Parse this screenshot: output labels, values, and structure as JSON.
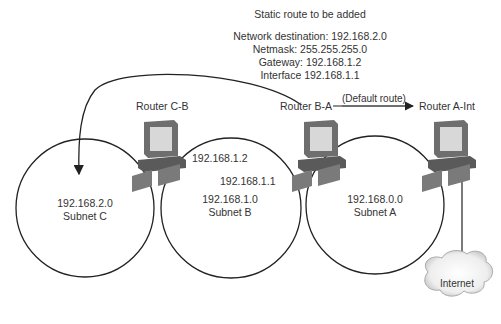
{
  "title": "Static route to be added",
  "route_details": {
    "network_destination": "Network destination: 192.168.2.0",
    "netmask": "Netmask: 255.255.255.0",
    "gateway": "Gateway: 192.168.1.2",
    "interface": "Interface 192.168.1.1"
  },
  "routers": [
    {
      "id": "router-c-b",
      "label": "Router C-B"
    },
    {
      "id": "router-b-a",
      "label": "Router B-A"
    },
    {
      "id": "router-a-int",
      "label": "Router A-Int"
    }
  ],
  "default_route_label": "(Default route)",
  "interfaces": {
    "cb_to_b": "192.168.1.2",
    "ba_to_b": "192.168.1.1"
  },
  "subnets": [
    {
      "network": "192.168.2.0",
      "name": "Subnet C"
    },
    {
      "network": "192.168.1.0",
      "name": "Subnet B"
    },
    {
      "network": "192.168.0.0",
      "name": "Subnet A"
    }
  ],
  "internet_label": "Internet",
  "colors": {
    "line": "#222222",
    "text": "#333333",
    "router_dark": "#6e6e6e",
    "router_screen": "#d8d8d8",
    "cloud": "#e6e6e6"
  }
}
